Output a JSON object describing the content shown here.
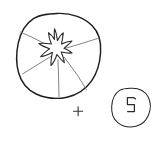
{
  "figure": {
    "title": "",
    "background_color": "#ffffff",
    "ink_color": "#1d1d1d",
    "segment_line_color": "#6d6d6d",
    "style": "hand-drawn line sketch",
    "equation_operator": "+"
  },
  "elements": {
    "fruit_cross_section": {
      "label": "fruit-cross-section",
      "shape": "circle",
      "center_x": 58,
      "center_y": 56,
      "radius": 42,
      "inner_shape": "star-splat",
      "segment_count": 4,
      "segment_line_count": 4
    },
    "splat": {
      "label": "star-splat-core",
      "center_x": 56,
      "center_y": 48,
      "points": 6
    },
    "operator": {
      "label": "plus-sign",
      "symbol": "+",
      "x": 78,
      "y": 111
    },
    "seed_circle": {
      "label": "seed-circle",
      "shape": "circle",
      "center_x": 131,
      "center_y": 107,
      "radius": 19,
      "inner_glyph": "zigzag-seed-mark"
    }
  }
}
